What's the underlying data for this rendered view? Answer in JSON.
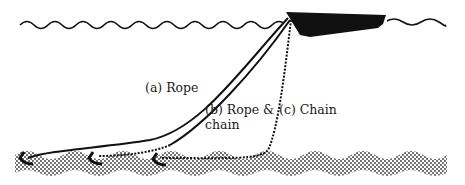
{
  "diagram": {
    "type": "mooring-line-comparison",
    "elements": {
      "surface": "water-surface-wave",
      "boat": "moored-boat",
      "seabed": "seabed-stippled"
    },
    "labels": {
      "rope": "(a) Rope",
      "rope_chain_line1": "(b) Rope &",
      "rope_chain_line2": "chain",
      "chain": "(c) Chain"
    },
    "colors": {
      "ink": "#111111",
      "background": "#ffffff",
      "seabed": "#555555"
    }
  }
}
